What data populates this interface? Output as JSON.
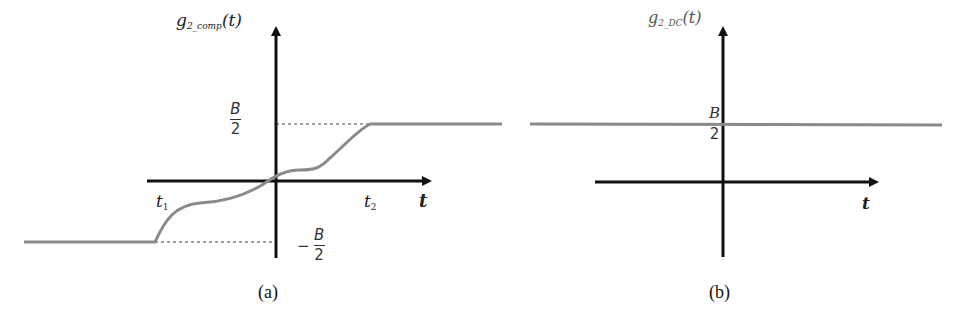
{
  "figure": {
    "panels": [
      {
        "id": "a",
        "caption": "(a)",
        "ylabel": {
          "base": "g",
          "sub": "2_comp",
          "arg": "(t)"
        },
        "xlabel": "t",
        "ticks": {
          "t1": "t",
          "t1_sub": "1",
          "t2": "t",
          "t2_sub": "2"
        },
        "levels": {
          "upper": {
            "num": "B",
            "den": "2",
            "sign": ""
          },
          "lower": {
            "num": "B",
            "den": "2",
            "sign": "−"
          }
        },
        "description": "Smooth S-shaped ramp from −B/2 (for t < t1) to +B/2 (for t > t2), with a plateau/inflection near the origin; dashed guides mark ±B/2 levels."
      },
      {
        "id": "b",
        "caption": "(b)",
        "ylabel": {
          "base": "g",
          "sub": "2_DC",
          "arg": "(t)"
        },
        "xlabel": "t",
        "levels": {
          "constant": {
            "num": "B",
            "den": "2"
          }
        },
        "description": "Constant horizontal line at B/2 for all t."
      }
    ],
    "colors": {
      "axis": "#111111",
      "curve": "#8a8a8a",
      "dashed": "#444444",
      "text": "#222222"
    }
  }
}
